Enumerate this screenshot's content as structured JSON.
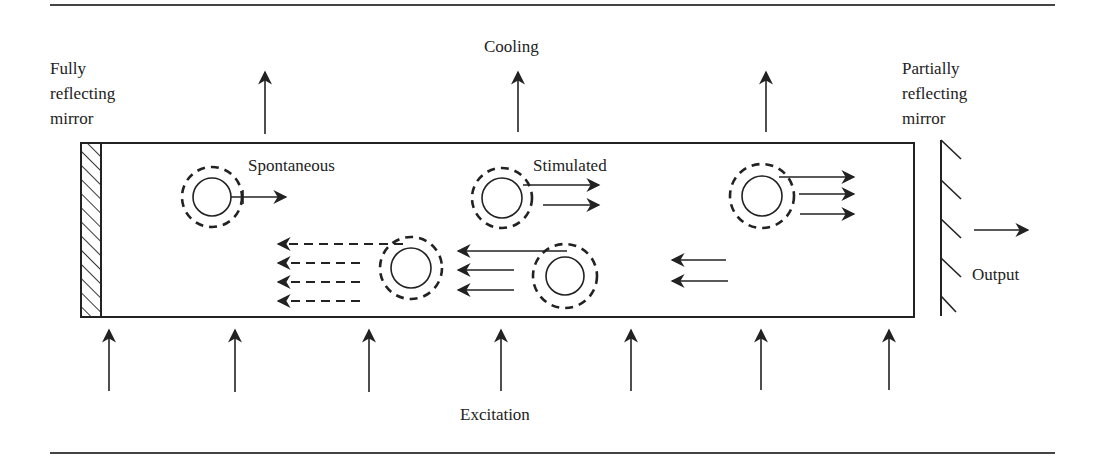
{
  "figure": {
    "type": "laser cavity schematic",
    "labels": {
      "left_mirror": [
        "Fully",
        "reflecting",
        "mirror"
      ],
      "right_mirror": [
        "Partially",
        "reflecting",
        "mirror"
      ],
      "cooling": "Cooling",
      "spontaneous": "Spontaneous",
      "stimulated": "Stimulated",
      "output": "Output",
      "excitation": "Excitation"
    },
    "cooling_arrow_count": 3,
    "excitation_arrow_count": 7,
    "atoms": [
      {
        "name": "atom-spontaneous-emission",
        "emitted_photons": 1,
        "direction": "right"
      },
      {
        "name": "atom-stimulated-emission",
        "emitted_photons": 2,
        "direction": "right"
      },
      {
        "name": "atom-right-amplified",
        "emitted_photons": 3,
        "direction": "right"
      },
      {
        "name": "atom-reflected-left",
        "emitted_photons": 4,
        "direction": "left",
        "style": "dashed"
      },
      {
        "name": "atom-reflected-middle",
        "emitted_photons": 3,
        "direction": "left"
      }
    ],
    "colors": {
      "ink": "#222222",
      "background": "#ffffff"
    }
  }
}
